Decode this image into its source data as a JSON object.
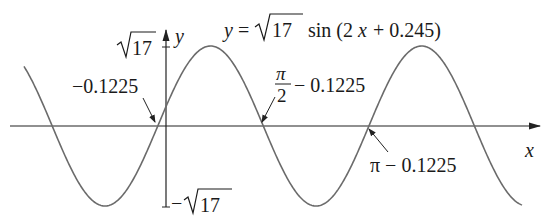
{
  "figure": {
    "equation": {
      "lhs": "y =",
      "radical": "17",
      "rhs": "sin (2",
      "var": "x",
      "tail": " + 0.245)"
    },
    "axes": {
      "x_label": "x",
      "y_label": "y",
      "y_top_tick": "17",
      "y_bottom_tick_sign": "−",
      "y_bottom_tick": "17"
    },
    "annotations": {
      "zero_left": "−0.1225",
      "zero_mid_num": "π",
      "zero_mid_den": "2",
      "zero_mid_tail": "− 0.1225",
      "zero_right": "π − 0.1225"
    },
    "colors": {
      "curve": "#6b6b6b",
      "axis": "#222222",
      "text": "#1a1a1a"
    }
  },
  "chart_data": {
    "type": "line",
    "xlabel": "x",
    "ylabel": "y",
    "function": "sqrt(17)*sin(2x + 0.245)",
    "amplitude": 4.1231,
    "period": 3.1416,
    "phase_shift": -0.1225,
    "ylim": [
      -4.1231,
      4.1231
    ],
    "y_ticks": [
      "√17",
      "−√17"
    ],
    "x_marked_zeros": [
      {
        "label": "−0.1225",
        "x": -0.1225
      },
      {
        "label": "π/2 − 0.1225",
        "x": 1.4483
      },
      {
        "label": "π − 0.1225",
        "x": 3.0191
      }
    ],
    "grid": false,
    "legend": null
  }
}
